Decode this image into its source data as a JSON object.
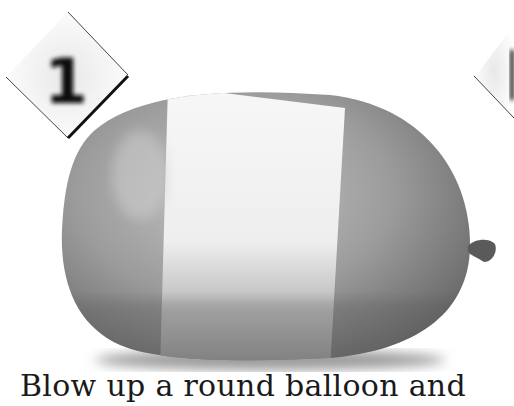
{
  "step": {
    "number": "1",
    "next_number_partial": "1"
  },
  "caption": {
    "text": "Blow up a round balloon and"
  },
  "illustration": {
    "subject": "balloon-with-tape-band",
    "colors": {
      "balloon_light": "#b4b4b4",
      "balloon_dark": "#6a6a6a",
      "tape": "#f2f2f2",
      "knot": "#555555",
      "badge_border": "#111111"
    }
  }
}
